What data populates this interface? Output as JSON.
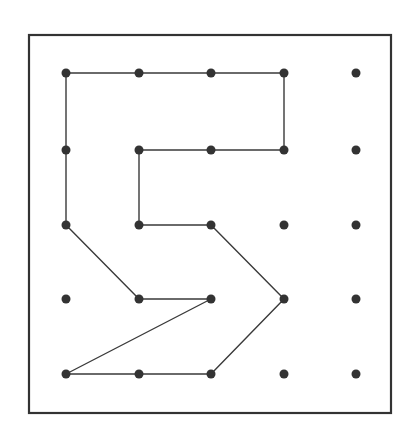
{
  "diagram": {
    "type": "geoboard",
    "board": {
      "x": 29,
      "y": 35,
      "width": 362,
      "height": 378,
      "border_color": "#333333",
      "border_width": 2.2,
      "background": "#ffffff"
    },
    "grid": {
      "columns": 5,
      "rows": 5,
      "x_positions": [
        66,
        139,
        211,
        284,
        356
      ],
      "y_positions": [
        73,
        150,
        225,
        299,
        374
      ],
      "peg_radius": 4.5,
      "peg_color": "#333333"
    },
    "band": {
      "color": "#3a3a3a",
      "width": 1.4,
      "description": "Closed polygon band forming the numeral 5 shape",
      "vertices": [
        [
          0,
          0
        ],
        [
          3,
          0
        ],
        [
          3,
          1
        ],
        [
          1,
          1
        ],
        [
          1,
          2
        ],
        [
          2,
          2
        ],
        [
          3,
          3
        ],
        [
          2,
          4
        ],
        [
          0,
          4
        ],
        [
          2,
          3
        ],
        [
          1,
          3
        ],
        [
          0,
          2
        ]
      ]
    }
  }
}
